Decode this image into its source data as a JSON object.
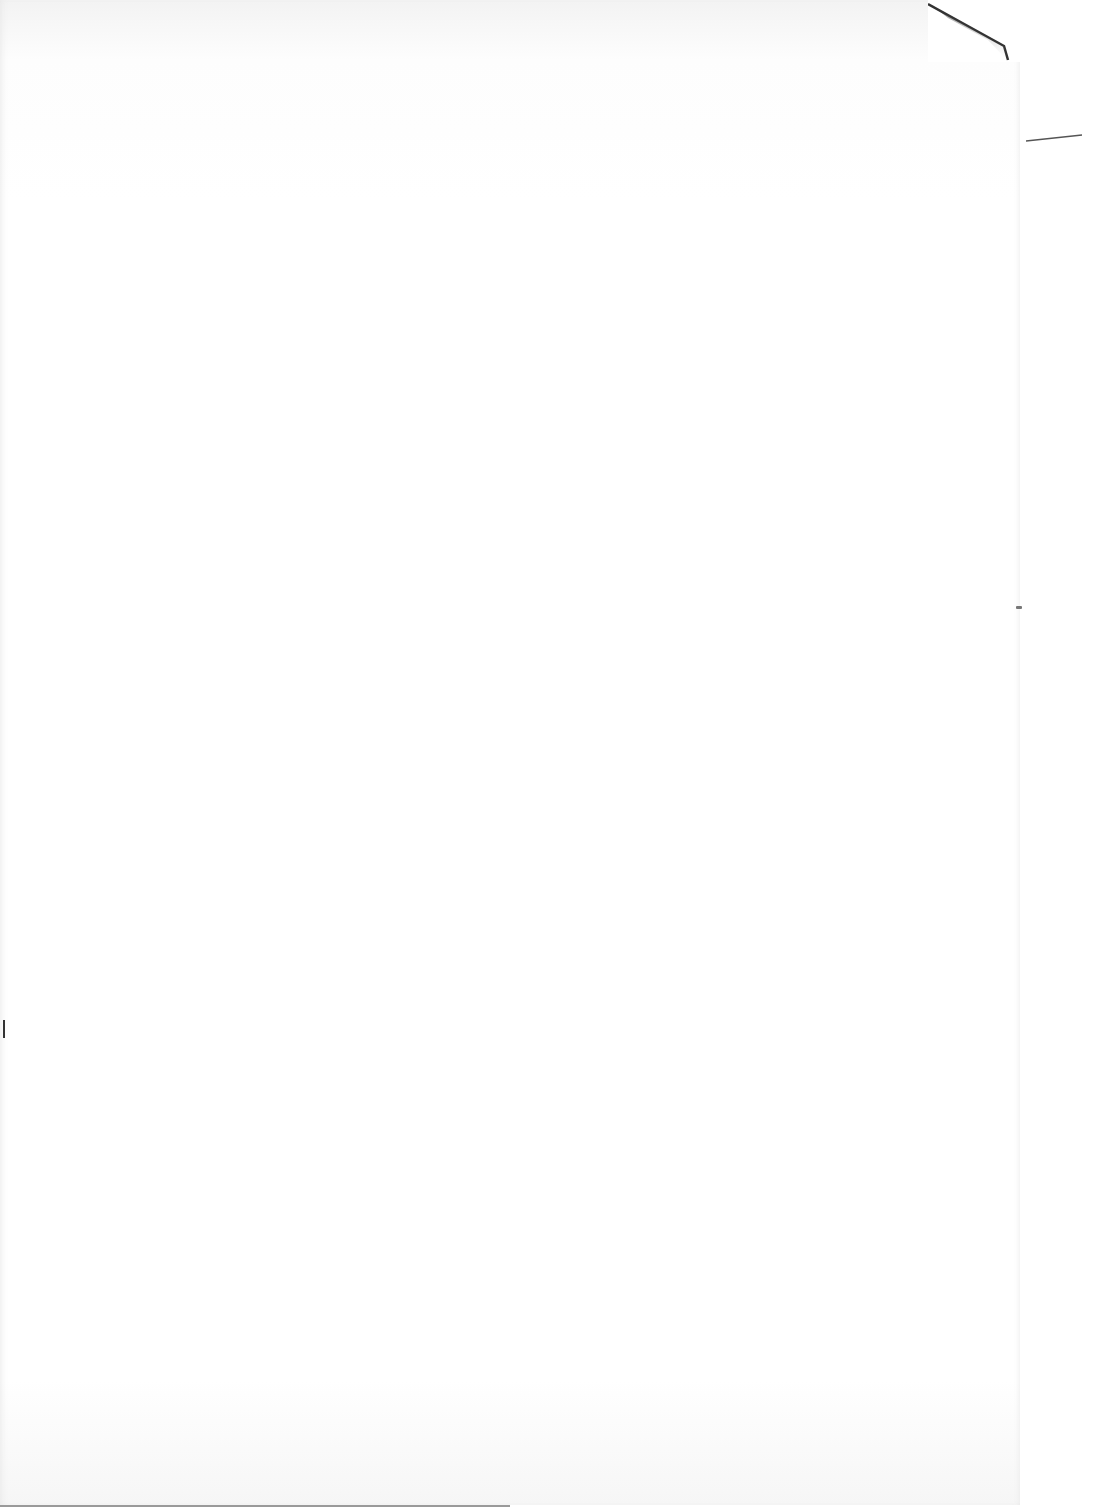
{
  "document": {
    "type": "scanned-page",
    "text": "",
    "state": "blank"
  },
  "colors": {
    "paper": "#ffffff",
    "edge_shadow": "#f3f3f3",
    "fold_shadow": "#2a2a2a"
  }
}
